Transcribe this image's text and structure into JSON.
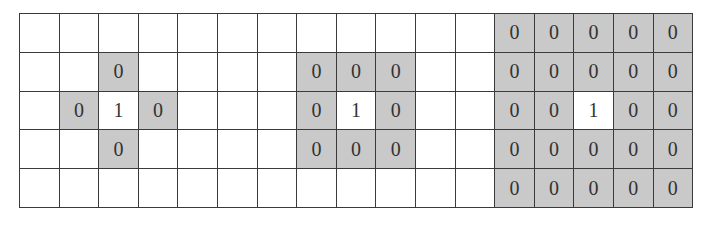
{
  "diagram": {
    "title": "",
    "rows": 5,
    "cols": 17,
    "colors": {
      "shaded": "#c9c9c9",
      "empty": "#ffffff",
      "line": "#3a3a3a",
      "text": "#333333"
    },
    "panels": [
      {
        "name": "4-neighborhood",
        "center": {
          "row": 2,
          "col": 2,
          "value": "1"
        },
        "neighbors": [
          {
            "row": 1,
            "col": 2,
            "value": "0"
          },
          {
            "row": 2,
            "col": 1,
            "value": "0"
          },
          {
            "row": 2,
            "col": 3,
            "value": "0"
          },
          {
            "row": 3,
            "col": 2,
            "value": "0"
          }
        ]
      },
      {
        "name": "8-neighborhood",
        "center": {
          "row": 2,
          "col": 8,
          "value": "1"
        },
        "neighbors": [
          {
            "row": 1,
            "col": 7,
            "value": "0"
          },
          {
            "row": 1,
            "col": 8,
            "value": "0"
          },
          {
            "row": 1,
            "col": 9,
            "value": "0"
          },
          {
            "row": 2,
            "col": 7,
            "value": "0"
          },
          {
            "row": 2,
            "col": 9,
            "value": "0"
          },
          {
            "row": 3,
            "col": 7,
            "value": "0"
          },
          {
            "row": 3,
            "col": 8,
            "value": "0"
          },
          {
            "row": 3,
            "col": 9,
            "value": "0"
          }
        ]
      },
      {
        "name": "5x5-neighborhood",
        "center": {
          "row": 2,
          "col": 14,
          "value": "1"
        },
        "block": {
          "row_start": 0,
          "row_end": 4,
          "col_start": 12,
          "col_end": 16,
          "value": "0"
        }
      }
    ],
    "cells": [
      [
        "",
        "",
        "",
        "",
        "",
        "",
        "",
        "",
        "",
        "",
        "",
        "",
        "0",
        "0",
        "0",
        "0",
        "0"
      ],
      [
        "",
        "",
        "0",
        "",
        "",
        "",
        "",
        "0",
        "0",
        "0",
        "",
        "",
        "0",
        "0",
        "0",
        "0",
        "0"
      ],
      [
        "",
        "0",
        "1",
        "0",
        "",
        "",
        "",
        "0",
        "1",
        "0",
        "",
        "",
        "0",
        "0",
        "1",
        "0",
        "0"
      ],
      [
        "",
        "",
        "0",
        "",
        "",
        "",
        "",
        "0",
        "0",
        "0",
        "",
        "",
        "0",
        "0",
        "0",
        "0",
        "0"
      ],
      [
        "",
        "",
        "",
        "",
        "",
        "",
        "",
        "",
        "",
        "",
        "",
        "",
        "0",
        "0",
        "0",
        "0",
        "0"
      ]
    ],
    "shaded": [
      [
        0,
        0,
        0,
        0,
        0,
        0,
        0,
        0,
        0,
        0,
        0,
        0,
        1,
        1,
        1,
        1,
        1
      ],
      [
        0,
        0,
        1,
        0,
        0,
        0,
        0,
        1,
        1,
        1,
        0,
        0,
        1,
        1,
        1,
        1,
        1
      ],
      [
        0,
        1,
        0,
        1,
        0,
        0,
        0,
        1,
        0,
        1,
        0,
        0,
        1,
        1,
        0,
        1,
        1
      ],
      [
        0,
        0,
        1,
        0,
        0,
        0,
        0,
        1,
        1,
        1,
        0,
        0,
        1,
        1,
        1,
        1,
        1
      ],
      [
        0,
        0,
        0,
        0,
        0,
        0,
        0,
        0,
        0,
        0,
        0,
        0,
        1,
        1,
        1,
        1,
        1
      ]
    ]
  }
}
